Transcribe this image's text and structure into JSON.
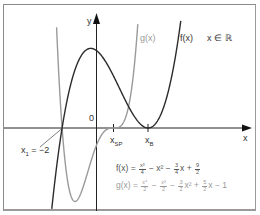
{
  "chart_data": {
    "type": "line",
    "title": "",
    "xlabel": "x",
    "ylabel": "y",
    "domain_note": "x ∈ ℝ",
    "xlim": [
      -5.5,
      9.2
    ],
    "ylim": [
      -5.0,
      7.2
    ],
    "grid": false,
    "legend_position": "inline labels near curves",
    "series": [
      {
        "name": "f(x)",
        "formula": "f(x) = x³/4 − x² − 3/4 x + 9/2",
        "coefficients": {
          "x3": 0.25,
          "x2": -1,
          "x1": -0.75,
          "x0": 4.5
        },
        "color": "#2b2b2b",
        "x": [
          -2.5,
          -2,
          -1.5,
          -1,
          -0.5,
          0,
          0.5,
          1,
          1.5,
          2,
          2.5,
          3,
          3.5,
          4,
          4.5,
          5
        ],
        "values": [
          -2.28,
          0,
          1.78,
          3.0,
          4.59,
          4.5,
          4.03,
          3.0,
          3.47,
          1.25,
          0.28,
          0,
          0.28,
          1.25,
          3.0,
          5.5
        ]
      },
      {
        "name": "g(x)",
        "formula": "g(x) = x⁴/2 − x³/2 − 3/2 x² + 5/2 x − 1",
        "coefficients": {
          "x4": 0.5,
          "x3": -0.5,
          "x2": -1.5,
          "x1": 2.5,
          "x0": -1
        },
        "color": "#9a9a9a",
        "x": [
          -2.3,
          -2,
          -1.5,
          -1,
          -0.5,
          0,
          0.5,
          1,
          1.5,
          2,
          2.3
        ],
        "values": [
          3.85,
          0,
          -4.22,
          -4.0,
          -2.53,
          -1,
          -0.16,
          0,
          0.22,
          1.0,
          2.22
        ]
      }
    ],
    "annotations": [
      {
        "label": "x₁ = −2",
        "x": -2,
        "y": 0
      },
      {
        "label": "x_SP",
        "x": 1,
        "y": 0
      },
      {
        "label": "x_B",
        "x": 3,
        "y": 0
      },
      {
        "label": "0",
        "x": 0,
        "y": 0
      }
    ]
  },
  "labels": {
    "y_axis": "y",
    "x_axis": "x",
    "origin": "0",
    "g_curve": "g(x)",
    "f_curve": "f(x)",
    "domain": "x ∈ ℝ",
    "x1": "x",
    "x1_sub": "1",
    "x1_value": " = −2",
    "xsp": "x",
    "xsp_sub": "SP",
    "xb": "x",
    "xb_sub": "B"
  },
  "formulas": {
    "f": {
      "lhs": "f(x) = ",
      "t1n": "x³",
      "t1d": "4",
      "t2": " − x² − ",
      "t3n": "3",
      "t3d": "4",
      "t4": "x + ",
      "t5n": "9",
      "t5d": "2"
    },
    "g": {
      "lhs": "g(x) = ",
      "t1n": "x⁴",
      "t1d": "2",
      "t2": " − ",
      "t3n": "x³",
      "t3d": "2",
      "t4": " − ",
      "t5n": "3",
      "t5d": "2",
      "t6": "x² + ",
      "t7n": "5",
      "t7d": "2",
      "t8": "x − 1"
    }
  }
}
